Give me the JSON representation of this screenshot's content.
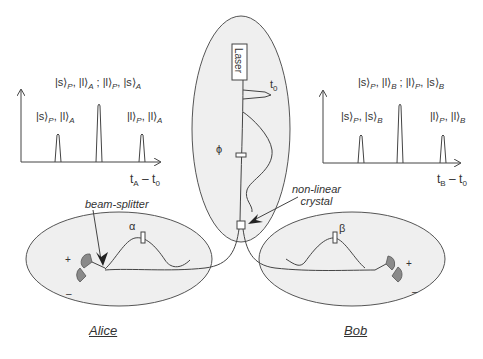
{
  "source": {
    "laser_label": "Laser",
    "t0_label": "t",
    "t0_sub": "0",
    "phase_label": "ϕ",
    "crystal_label_line1": "non-linear",
    "crystal_label_line2": "crystal"
  },
  "alice": {
    "name": "Alice",
    "phase_label": "α",
    "beam_splitter_label": "beam-splitter",
    "plus_label": "+",
    "minus_label": "–",
    "chart": {
      "peak_left": {
        "ket1": "|s⟩",
        "sub1": "P",
        "ket2": ", |l⟩",
        "sub2": "A"
      },
      "peak_center": {
        "ket1": "|s⟩",
        "sub1": "P",
        "ket2": ", |l⟩",
        "sub2": "A",
        "sep": " ; ",
        "ket3": "|l⟩",
        "sub3": "P",
        "ket4": ", |s⟩",
        "sub4": "A"
      },
      "peak_right": {
        "ket1": "|l⟩",
        "sub1": "P",
        "ket2": ", |l⟩",
        "sub2": "A"
      },
      "xlabel_t": "t",
      "xlabel_sub": "A",
      "xlabel_rest": " – t",
      "xlabel_sub2": "0"
    }
  },
  "bob": {
    "name": "Bob",
    "phase_label": "β",
    "plus_label": "+",
    "minus_label": "–",
    "chart": {
      "peak_left": {
        "ket1": "|s⟩",
        "sub1": "P",
        "ket2": ", |s⟩",
        "sub2": "B"
      },
      "peak_center": {
        "ket1": "|s⟩",
        "sub1": "P",
        "ket2": ", |l⟩",
        "sub2": "B",
        "sep": " ; ",
        "ket3": "|l⟩",
        "sub3": "P",
        "ket4": ", |s⟩",
        "sub4": "B"
      },
      "peak_right": {
        "ket1": "|l⟩",
        "sub1": "P",
        "ket2": ", |l⟩",
        "sub2": "B"
      },
      "xlabel_t": "t",
      "xlabel_sub": "B",
      "xlabel_rest": " – t",
      "xlabel_sub2": "0"
    }
  },
  "colors": {
    "ellipse_fill": "#efefef",
    "line": "#444444",
    "detector": "#8a8a8a"
  }
}
